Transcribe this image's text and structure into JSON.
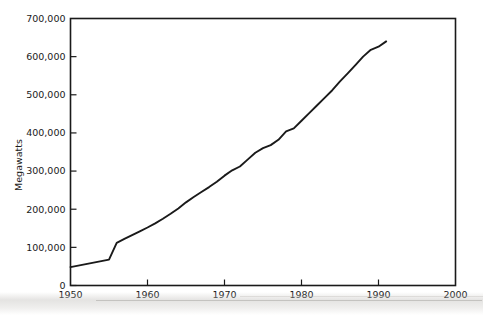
{
  "chart_data": {
    "type": "line",
    "title": "",
    "xlabel": "",
    "ylabel": "Megawatts",
    "xlim": [
      1950,
      2000
    ],
    "ylim": [
      0,
      700000
    ],
    "grid": false,
    "legend": null,
    "x_ticks": [
      "1950",
      "1960",
      "1970",
      "1980",
      "1990",
      "2000"
    ],
    "x_tick_values": [
      1950,
      1960,
      1970,
      1980,
      1990,
      2000
    ],
    "y_ticks": [
      "0",
      "100,000",
      "200,000",
      "300,000",
      "400,000",
      "500,000",
      "600,000",
      "700,000"
    ],
    "y_tick_values": [
      0,
      100000,
      200000,
      300000,
      400000,
      500000,
      600000,
      700000
    ],
    "series": [
      {
        "name": "Megawatts",
        "color": "#1a1a1a",
        "x": [
          1950,
          1951,
          1952,
          1953,
          1954,
          1955,
          1956,
          1957,
          1958,
          1959,
          1960,
          1961,
          1962,
          1963,
          1964,
          1965,
          1966,
          1967,
          1968,
          1969,
          1970,
          1971,
          1972,
          1973,
          1974,
          1975,
          1976,
          1977,
          1978,
          1979,
          1980,
          1981,
          1982,
          1983,
          1984,
          1985,
          1986,
          1987,
          1988,
          1989,
          1990,
          1991
        ],
        "values": [
          48000,
          52000,
          56000,
          60000,
          64000,
          68000,
          112000,
          122000,
          132000,
          142000,
          152000,
          163000,
          175000,
          188000,
          202000,
          218000,
          232000,
          245000,
          258000,
          272000,
          288000,
          302000,
          312000,
          330000,
          348000,
          360000,
          368000,
          382000,
          404000,
          412000,
          432000,
          452000,
          472000,
          492000,
          512000,
          535000,
          556000,
          578000,
          600000,
          618000,
          626000,
          640000
        ]
      }
    ]
  },
  "axis": {
    "y_title": "Megawatts"
  }
}
